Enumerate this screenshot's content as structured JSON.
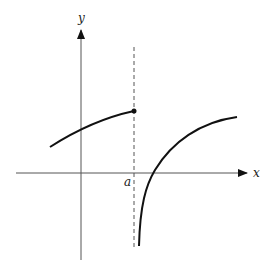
{
  "diagram": {
    "type": "function-graph-jump-discontinuity",
    "labels": {
      "x_axis": "x",
      "y_axis": "y",
      "vertical_line": "a"
    },
    "colors": {
      "curve": "#111111",
      "axis": "#555555",
      "dashed": "#555555",
      "label": "#1a1a1a",
      "background": "#ffffff"
    },
    "elements": {
      "x_axis": {
        "from": [
          16,
          173
        ],
        "to": [
          248,
          173
        ]
      },
      "y_axis": {
        "from": [
          81,
          260
        ],
        "to": [
          81,
          29
        ]
      },
      "dashed_line": {
        "x": 134,
        "y_top": 47,
        "y_bottom": 250
      },
      "left_branch": {
        "start": [
          50,
          147
        ],
        "end": [
          134,
          111
        ],
        "closed_endpoint": true
      },
      "right_branch": {
        "start": [
          139,
          246
        ],
        "x_intercept": [
          153,
          173
        ],
        "end": [
          237,
          117
        ]
      }
    }
  }
}
